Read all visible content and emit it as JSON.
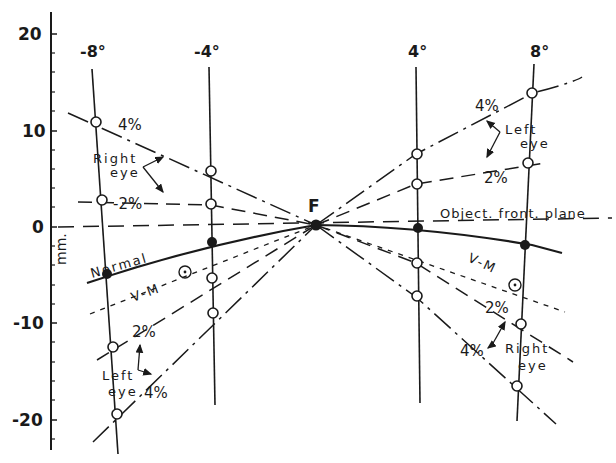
{
  "figure": {
    "type": "horopter-diagram",
    "y_axis": {
      "label": "mm.",
      "ticks": [
        "20",
        "10",
        "0",
        "-10",
        "-20"
      ],
      "tick_values": [
        20,
        10,
        0,
        -10,
        -20
      ]
    },
    "columns": [
      {
        "label": "-8°",
        "angle": -8
      },
      {
        "label": "-4°",
        "angle": -4
      },
      {
        "label": "4°",
        "angle": 4
      },
      {
        "label": "8°",
        "angle": 8
      }
    ],
    "fixation_label": "F",
    "object_plane_label": "Object. front. plane",
    "curves": {
      "normal": "Normal",
      "vm": "V-M",
      "right_eye_4": "4%",
      "right_eye_2": "-2%",
      "left_eye_2_left": "2%",
      "left_eye_4_left": "4%",
      "left_eye_4_right": "4%",
      "left_eye_2_right": "2%",
      "right_eye_2_right": "2%",
      "right_eye_4_right": "4%"
    },
    "annotations": {
      "right_eye_upper_left": [
        "Right",
        "eye"
      ],
      "left_eye_lower_left": [
        "Left",
        "eye"
      ],
      "left_eye_upper_right": [
        "Left",
        "eye"
      ],
      "right_eye_lower_right": [
        "Right",
        "eye"
      ]
    },
    "data_points_mm": {
      "normal": {
        "-8": -5,
        "-4": -1.5,
        "0": 0,
        "4": 0,
        "8": -2
      },
      "right_eye_4pct": {
        "-8": 11,
        "-4": 6
      },
      "right_eye_2pct": {
        "-8": 3,
        "-4": 2.5
      },
      "left_eye_2pct_left": {
        "-8": -12.5,
        "-4": -5
      },
      "left_eye_4pct_left": {
        "-8": -19,
        "-4": -9
      },
      "left_eye_4pct_right": {
        "4": 7.5,
        "8": 14
      },
      "left_eye_2pct_right": {
        "4": 4.5,
        "8": 7
      },
      "right_eye_2pct_right": {
        "4": -4,
        "8": -10
      },
      "right_eye_4pct_right": {
        "4": -7,
        "8": -16.5
      }
    }
  }
}
